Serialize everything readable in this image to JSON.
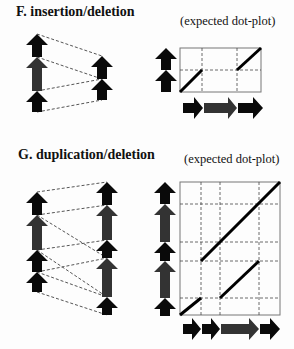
{
  "panels": {
    "F": {
      "title": "F. insertion/deletion",
      "subtitle": "(expected dot-plot)"
    },
    "G": {
      "title": "G. duplication/deletion",
      "subtitle": "(expected dot-plot)"
    }
  },
  "colors": {
    "black_segment": "#0a0a0a",
    "grey_segment": "#333333",
    "dash_line": "#555555",
    "grid_line": "#444444",
    "box_border": "#777777",
    "diagonal": "#000000"
  }
}
